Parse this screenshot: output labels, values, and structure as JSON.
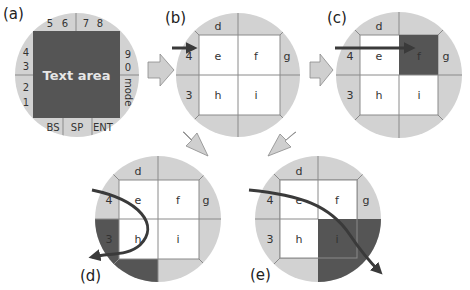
{
  "colors": {
    "ring": "#d2d2d2",
    "ring_line": "#8a8a8a",
    "inner": "#ffffff",
    "highlight": "#555555",
    "arrow": "#3a3a3a",
    "transition_arrow": "#cfcfcf",
    "transition_arrow_stroke": "#8a8a8a"
  },
  "panels": {
    "a": {
      "label": "(a)",
      "center_text": "Text area",
      "top_keys": [
        "5",
        "6",
        "7",
        "8"
      ],
      "left_keys": [
        "4",
        "3",
        "2",
        "1"
      ],
      "right_keys": [
        "9",
        "0",
        "mode"
      ],
      "bottom_keys": [
        "BS",
        "SP",
        "ENT"
      ]
    },
    "b": {
      "label": "(b)",
      "cells": {
        "top": "d",
        "left_upper": "4",
        "left_lower": "3",
        "right_upper": "g",
        "e": "e",
        "f": "f",
        "h": "h",
        "i": "i"
      },
      "annotation": "arrow entering from left toward cell e"
    },
    "c": {
      "label": "(c)",
      "cells": {
        "top": "d",
        "left_upper": "4",
        "left_lower": "3",
        "right_upper": "g",
        "e": "e",
        "f": "f",
        "h": "h",
        "i": "i"
      },
      "highlighted": "f",
      "annotation": "straight arrow across e into f"
    },
    "d": {
      "label": "(d)",
      "cells": {
        "top": "d",
        "left_upper": "4",
        "left_lower": "3",
        "right_upper": "g",
        "e": "e",
        "f": "f",
        "h": "h",
        "i": "i"
      },
      "highlighted": "3 and bottom-left segment",
      "annotation": "curved arrow looping through e and h back to the left"
    },
    "e": {
      "label": "(e)",
      "cells": {
        "top": "d",
        "left_upper": "4",
        "left_lower": "3",
        "right_upper": "g",
        "e": "e",
        "f": "f",
        "h": "h",
        "i": "i"
      },
      "highlighted": "i quadrant",
      "annotation": "curved arrow sweeping from left over e and f down through i"
    }
  }
}
